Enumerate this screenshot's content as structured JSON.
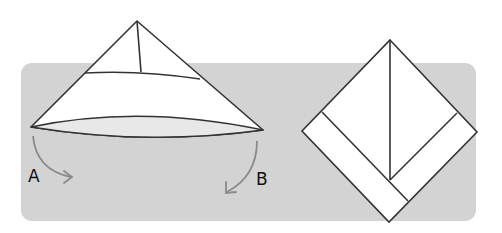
{
  "diagram": {
    "colors": {
      "background": "#ffffff",
      "panel": "#d3d3d3",
      "paper": "#ffffff",
      "lens": "#e8e8e8",
      "stroke": "#333333",
      "arrow": "#8a8a8a",
      "label": "#111111"
    },
    "labels": {
      "a": "A",
      "b": "B"
    },
    "steps": [
      {
        "name": "fold-step",
        "note": "Fold corners A and B downward"
      },
      {
        "name": "result-step",
        "note": "Resulting diamond shape"
      }
    ]
  }
}
